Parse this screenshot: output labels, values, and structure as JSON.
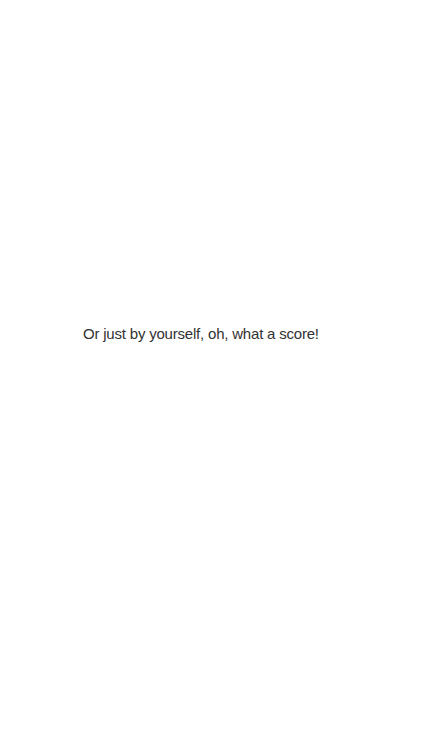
{
  "page": {
    "background_color": "#ffffff",
    "text_color": "#323232",
    "line": "Or just by yourself, oh, what a score!"
  }
}
